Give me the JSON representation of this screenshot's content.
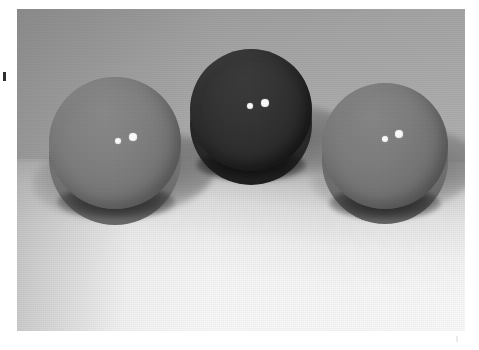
{
  "scene": {
    "title": "Three cylindrical discs on a light surface",
    "medium": "grayscale photograph",
    "object_count": 3,
    "background": {
      "backdrop_color": "#a6a6a6",
      "ground_color": "#f7f7f7",
      "horizon_y": 150,
      "light_direction": "upper-right",
      "shadow_direction": "lower-left"
    },
    "frame": {
      "page_background": "#ffffff",
      "photo_left": 17,
      "photo_top": 9,
      "photo_width": 448,
      "photo_height": 322
    }
  },
  "objects": [
    {
      "id": "disc-left",
      "label": "left disc",
      "shape": "cylinder",
      "face_color": "#7d7d7d",
      "side_color": "#6b6b6b",
      "diameter_px": 132,
      "center_x": 115,
      "center_y": 143,
      "dots": [
        {
          "id": "left-dot-1",
          "cx": 118,
          "cy": 141,
          "r": 3.4,
          "color": "#ffffff"
        },
        {
          "id": "left-dot-2",
          "cx": 133,
          "cy": 137,
          "r": 4.4,
          "color": "#ffffff"
        }
      ]
    },
    {
      "id": "disc-mid",
      "label": "middle disc",
      "shape": "cylinder",
      "face_color": "#2e2e2e",
      "side_color": "#232323",
      "diameter_px": 122,
      "center_x": 251,
      "center_y": 110,
      "dots": [
        {
          "id": "mid-dot-1",
          "cx": 250,
          "cy": 106,
          "r": 3.4,
          "color": "#ffffff"
        },
        {
          "id": "mid-dot-2",
          "cx": 265,
          "cy": 103,
          "r": 4.4,
          "color": "#ffffff"
        }
      ]
    },
    {
      "id": "disc-right",
      "label": "right disc",
      "shape": "cylinder",
      "face_color": "#767676",
      "side_color": "#676767",
      "diameter_px": 126,
      "center_x": 385,
      "center_y": 146,
      "dots": [
        {
          "id": "right-dot-1",
          "cx": 385,
          "cy": 139,
          "r": 3.4,
          "color": "#ffffff"
        },
        {
          "id": "right-dot-2",
          "cx": 399,
          "cy": 134,
          "r": 4.4,
          "color": "#ffffff"
        }
      ]
    }
  ],
  "shadows": [
    {
      "id": "shadow-left",
      "owner": "disc-left"
    },
    {
      "id": "shadow-mid",
      "owner": "disc-mid"
    },
    {
      "id": "shadow-right",
      "owner": "disc-right"
    }
  ],
  "marks": {
    "left_edge_tick": "",
    "bottom_right_tick": ""
  }
}
